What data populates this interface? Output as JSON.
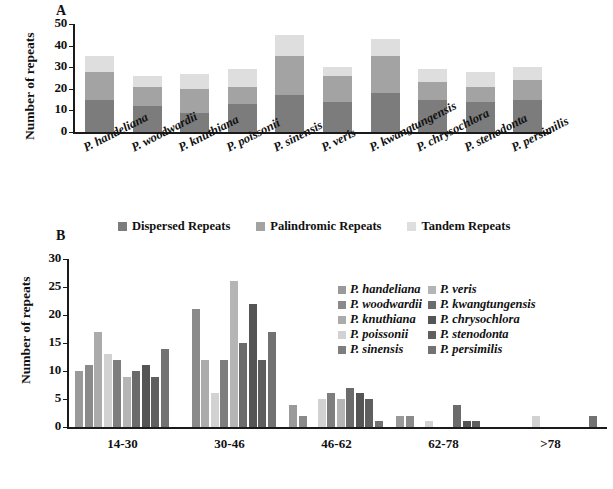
{
  "figure": {
    "panel_a_letter": "A",
    "panel_b_letter": "B"
  },
  "chart_data": [
    {
      "type": "bar",
      "id": "panel-a",
      "title": "",
      "subtype": "stacked",
      "xlabel": "",
      "ylabel": "Number of  repeats",
      "ylim": [
        0,
        50
      ],
      "yticks": [
        0,
        10,
        20,
        30,
        40,
        50
      ],
      "grid": false,
      "legend_position": "bottom",
      "categories": [
        "P. handeliana",
        "P. woodwardii",
        "P. knuthiana",
        "P. poissonii",
        "P. sinensis",
        "P. veris",
        "P. kwangtungensis",
        "P. chrysochlora",
        "P. stenodonta",
        "P. persimilis"
      ],
      "series": [
        {
          "name": "Dispersed Repeats",
          "color": "#7c7c7c",
          "values": [
            15,
            12,
            9,
            13,
            17,
            14,
            18,
            15,
            14,
            15
          ]
        },
        {
          "name": "Palindromic Repeats",
          "color": "#a3a3a3",
          "values": [
            13,
            9,
            11,
            8,
            18,
            12,
            17,
            8,
            7,
            9
          ]
        },
        {
          "name": "Tandem Repeats",
          "color": "#dedede",
          "values": [
            7,
            5,
            7,
            8,
            10,
            4,
            8,
            6,
            7,
            6
          ]
        }
      ]
    },
    {
      "type": "bar",
      "id": "panel-b",
      "title": "",
      "subtype": "grouped",
      "xlabel": "",
      "ylabel": "Number of repeats",
      "ylim": [
        0,
        30
      ],
      "yticks": [
        0,
        5,
        10,
        15,
        20,
        25,
        30
      ],
      "grid": false,
      "legend_position": "right",
      "categories": [
        "14-30",
        "30-46",
        "46-62",
        "62-78",
        ">78"
      ],
      "series": [
        {
          "name": "P. handeliana",
          "color": "#9a9a9a",
          "values": [
            10,
            0,
            4,
            2,
            0
          ]
        },
        {
          "name": "P. woodwardii",
          "color": "#8a8a8a",
          "values": [
            11,
            21,
            2,
            2,
            0
          ]
        },
        {
          "name": "P. knuthiana",
          "color": "#ababab",
          "values": [
            17,
            12,
            0,
            0,
            0
          ]
        },
        {
          "name": "P. poissonii",
          "color": "#d2d2d2",
          "values": [
            13,
            6,
            5,
            1,
            2
          ]
        },
        {
          "name": "P. sinensis",
          "color": "#7e7e7e",
          "values": [
            12,
            12,
            6,
            0,
            0
          ]
        },
        {
          "name": "P. veris",
          "color": "#b5b5b5",
          "values": [
            9,
            26,
            5,
            0,
            0
          ]
        },
        {
          "name": "P. kwangtungensis",
          "color": "#6b6b6b",
          "values": [
            10,
            15,
            7,
            4,
            0
          ]
        },
        {
          "name": "P. chrysochlora",
          "color": "#555555",
          "values": [
            11,
            22,
            6,
            1,
            0
          ]
        },
        {
          "name": "P. stenodonta",
          "color": "#5f5f5f",
          "values": [
            9,
            12,
            5,
            1,
            0
          ]
        },
        {
          "name": "P. persimilis",
          "color": "#727272",
          "values": [
            14,
            17,
            1,
            0,
            2
          ]
        }
      ]
    }
  ]
}
